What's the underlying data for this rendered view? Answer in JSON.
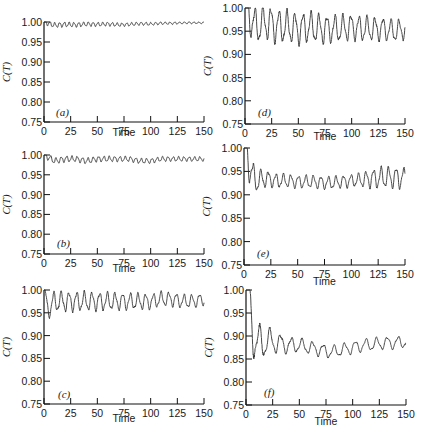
{
  "figure": {
    "xlabel": "Time",
    "ylabel": "C(T)",
    "xticks": [
      "0",
      "25",
      "50",
      "75",
      "100",
      "125",
      "150"
    ],
    "yticks": [
      "0.75",
      "0.80",
      "0.85",
      "0.90",
      "0.95",
      "1.00"
    ],
    "line_color": "#333333",
    "axis_color": "#111111"
  },
  "chart_data": [
    {
      "type": "line",
      "panel": "(a)",
      "title": "",
      "xlabel": "Time",
      "ylabel": "C(T)",
      "xlim": [
        0,
        150
      ],
      "ylim": [
        0.75,
        1.0
      ],
      "grid": false,
      "description": "Small rapid oscillation close to 1.00, damping over time",
      "mean": 0.996,
      "x": [
        0,
        10,
        20,
        30,
        40,
        50,
        60,
        70,
        80,
        90,
        100,
        110,
        120,
        130,
        140,
        150
      ],
      "values": [
        1.0,
        0.992,
        0.994,
        0.993,
        0.995,
        0.994,
        0.995,
        0.993,
        0.994,
        0.996,
        0.995,
        0.997,
        0.997,
        0.998,
        0.998,
        0.998
      ],
      "osc": {
        "base": 0.996,
        "amp_start": 0.006,
        "amp_end": 0.002,
        "period": 4.5
      }
    },
    {
      "type": "line",
      "panel": "(b)",
      "title": "",
      "xlabel": "Time",
      "ylabel": "C(T)",
      "xlim": [
        0,
        150
      ],
      "ylim": [
        0.75,
        1.0
      ],
      "grid": false,
      "description": "Oscillation near 0.99 with bursts of larger amplitude",
      "mean": 0.99,
      "x": [
        0,
        10,
        20,
        30,
        40,
        50,
        60,
        70,
        80,
        90,
        100,
        110,
        120,
        130,
        140,
        150
      ],
      "values": [
        1.0,
        0.985,
        0.99,
        0.99,
        0.985,
        0.99,
        0.99,
        0.99,
        0.99,
        0.985,
        0.985,
        0.99,
        0.99,
        0.99,
        0.99,
        0.99
      ],
      "osc": {
        "base": 0.991,
        "amp_start": 0.007,
        "amp_end": 0.005,
        "period": 5.0
      }
    },
    {
      "type": "line",
      "panel": "(c)",
      "title": "",
      "xlabel": "Time",
      "ylabel": "C(T)",
      "xlim": [
        0,
        150
      ],
      "ylim": [
        0.75,
        1.0
      ],
      "grid": false,
      "description": "Regular oscillation between ~0.955 and 1.00, becoming irregular after t~100",
      "mean": 0.975,
      "x": [
        0,
        10,
        20,
        30,
        40,
        50,
        60,
        70,
        80,
        90,
        100,
        110,
        120,
        130,
        140,
        150
      ],
      "values": [
        0.95,
        0.975,
        0.975,
        0.975,
        0.975,
        0.975,
        0.975,
        0.975,
        0.975,
        0.975,
        0.975,
        0.98,
        0.98,
        0.975,
        0.975,
        0.98
      ],
      "osc": {
        "base": 0.977,
        "amp_start": 0.021,
        "amp_end": 0.012,
        "period": 7.2
      }
    },
    {
      "type": "line",
      "panel": "(d)",
      "title": "",
      "xlabel": "Time",
      "ylabel": "C(T)",
      "xlim": [
        0,
        150
      ],
      "ylim": [
        0.75,
        1.0
      ],
      "grid": false,
      "description": "Oscillation between ~0.92 and 1.00 around 0.96",
      "mean": 0.958,
      "x": [
        0,
        10,
        20,
        30,
        40,
        50,
        60,
        70,
        80,
        90,
        100,
        110,
        120,
        130,
        140,
        150
      ],
      "values": [
        1.0,
        0.96,
        0.97,
        0.96,
        0.96,
        0.955,
        0.96,
        0.955,
        0.955,
        0.955,
        0.96,
        0.955,
        0.955,
        0.955,
        0.95,
        0.955
      ],
      "osc": {
        "base": 0.958,
        "amp_start": 0.035,
        "amp_end": 0.02,
        "period": 7.5
      }
    },
    {
      "type": "line",
      "panel": "(e)",
      "title": "",
      "xlabel": "Time",
      "ylabel": "C(T)",
      "xlim": [
        0,
        150
      ],
      "ylim": [
        0.75,
        1.0
      ],
      "grid": false,
      "description": "Large initial oscillation damping to ~0.93 by t~30, slight growth after t~110",
      "mean": 0.93,
      "x": [
        0,
        10,
        20,
        30,
        40,
        50,
        60,
        70,
        80,
        90,
        100,
        110,
        120,
        130,
        140,
        150
      ],
      "values": [
        1.0,
        0.93,
        0.935,
        0.93,
        0.93,
        0.928,
        0.928,
        0.927,
        0.925,
        0.928,
        0.93,
        0.932,
        0.935,
        0.937,
        0.937,
        0.935
      ],
      "osc": {
        "base": 0.93,
        "amp_start": 0.045,
        "amp_end": 0.012,
        "period": 7.0
      }
    },
    {
      "type": "line",
      "panel": "(f)",
      "title": "",
      "xlabel": "Time",
      "ylabel": "C(T)",
      "xlim": [
        0,
        150
      ],
      "ylim": [
        0.75,
        1.0
      ],
      "grid": false,
      "description": "Strong initial oscillation (min ~0.82, max ~0.965) damping to ~0.87, then rising toward ~0.885",
      "mean": 0.875,
      "x": [
        0,
        10,
        20,
        30,
        40,
        50,
        60,
        70,
        80,
        90,
        100,
        110,
        120,
        130,
        140,
        150
      ],
      "values": [
        1.0,
        0.88,
        0.89,
        0.885,
        0.88,
        0.88,
        0.875,
        0.87,
        0.865,
        0.87,
        0.875,
        0.88,
        0.882,
        0.885,
        0.885,
        0.888
      ],
      "osc": {
        "base": 0.878,
        "amp_start": 0.075,
        "amp_end": 0.012,
        "period": 10.0
      }
    }
  ]
}
